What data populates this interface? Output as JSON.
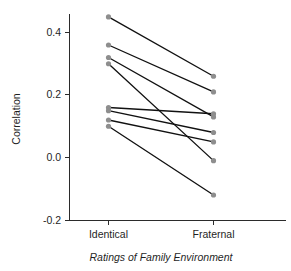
{
  "chart_data": {
    "type": "line",
    "title": "",
    "subtitle": "",
    "xlabel": "Ratings of Family Environment",
    "ylabel": "Correlation",
    "categories": [
      "Identical",
      "Fraternal"
    ],
    "xtick_labels": [
      "Identical",
      "Fraternal"
    ],
    "ytick_labels": [
      "0.4",
      "0.2",
      "0.0",
      "-0.2"
    ],
    "ytick_values": [
      0.4,
      0.2,
      0.0,
      -0.2
    ],
    "ylim": [
      -0.2,
      0.47
    ],
    "xlim": [
      0,
      1
    ],
    "grid": false,
    "legend": "none",
    "point_color": "#8e8e8e",
    "line_color": "#111111",
    "axis_color": "#2b2b2b",
    "series": [
      {
        "name": "pair-1",
        "values": [
          0.45,
          0.26
        ]
      },
      {
        "name": "pair-2",
        "values": [
          0.36,
          0.21
        ]
      },
      {
        "name": "pair-3",
        "values": [
          0.32,
          0.13
        ]
      },
      {
        "name": "pair-4",
        "values": [
          0.3,
          -0.01
        ]
      },
      {
        "name": "pair-5",
        "values": [
          0.16,
          0.14
        ]
      },
      {
        "name": "pair-6",
        "values": [
          0.15,
          0.08
        ]
      },
      {
        "name": "pair-7",
        "values": [
          0.12,
          0.05
        ]
      },
      {
        "name": "pair-8",
        "values": [
          0.1,
          -0.12
        ]
      }
    ]
  },
  "axes": {
    "y_title": "Correlation",
    "x_title": "Ratings of Family Environment",
    "y_ticks": [
      {
        "label": "0.4",
        "value": 0.4
      },
      {
        "label": "0.2",
        "value": 0.2
      },
      {
        "label": "0.0",
        "value": 0.0
      },
      {
        "label": "-0.2",
        "value": -0.2
      }
    ],
    "x_ticks": [
      {
        "label": "Identical",
        "value": 0
      },
      {
        "label": "Fraternal",
        "value": 1
      }
    ]
  }
}
